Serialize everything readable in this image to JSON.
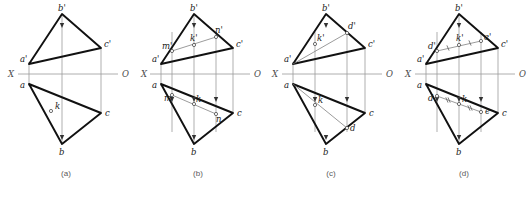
{
  "figure": {
    "title": "",
    "kind": "descriptive-geometry-projection-plates",
    "canvas": {
      "width": 529,
      "height": 197
    },
    "axis": {
      "left_label": "X",
      "right_label": "O",
      "y": 74
    },
    "panels": [
      {
        "id": "a",
        "caption": "(a)",
        "caption_x": 66,
        "caption_y": 176,
        "origin_x": 0,
        "axis_x_label_x": 8,
        "axis_x_label_y": 77,
        "axis_o_label_x": 122,
        "axis_o_label_y": 77,
        "axis_start": 18,
        "axis_end": 118,
        "vertices": {
          "b_prime": {
            "x": 62,
            "y": 14,
            "label": "b'",
            "lx": 58,
            "ly": 11
          },
          "c_prime": {
            "x": 101,
            "y": 48,
            "label": "c'",
            "lx": 104,
            "ly": 47
          },
          "a_prime": {
            "x": 29,
            "y": 64,
            "label": "a'",
            "lx": 20,
            "ly": 62
          },
          "a": {
            "x": 29,
            "y": 84,
            "label": "a",
            "lx": 20,
            "ly": 88
          },
          "c": {
            "x": 101,
            "y": 113,
            "label": "c",
            "lx": 105,
            "ly": 116
          },
          "b": {
            "x": 62,
            "y": 144,
            "label": "b",
            "lx": 59,
            "ly": 155
          },
          "k": {
            "x": 51,
            "y": 111,
            "label": "k",
            "lx": 55,
            "ly": 109
          }
        },
        "extra_points": [
          {
            "name": "k",
            "x": 51,
            "y": 111,
            "label": "k",
            "lx": 55,
            "ly": 109
          }
        ],
        "arrows": [],
        "verticals": [
          29,
          62,
          101
        ],
        "ticks": []
      },
      {
        "id": "b",
        "caption": "(b)",
        "caption_x": 198,
        "caption_y": 176,
        "origin_x": 130,
        "axis_x_label_x": 141,
        "axis_x_label_y": 77,
        "axis_o_label_x": 254,
        "axis_o_label_y": 77,
        "axis_pre_label_x": 130,
        "axis_start": 150,
        "axis_end": 250,
        "vertices": {
          "b_prime": {
            "x": 194,
            "y": 14,
            "label": "b'",
            "lx": 190,
            "ly": 11
          },
          "c_prime": {
            "x": 233,
            "y": 48,
            "label": "c'",
            "lx": 236,
            "ly": 47
          },
          "a_prime": {
            "x": 161,
            "y": 64,
            "label": "a'",
            "lx": 152,
            "ly": 62
          },
          "a": {
            "x": 161,
            "y": 84,
            "label": "a",
            "lx": 152,
            "ly": 88
          },
          "c": {
            "x": 233,
            "y": 113,
            "label": "c",
            "lx": 237,
            "ly": 116
          },
          "b": {
            "x": 194,
            "y": 144,
            "label": "b",
            "lx": 191,
            "ly": 155
          }
        },
        "extra_points": [
          {
            "name": "m_prime",
            "x": 172,
            "y": 51,
            "label": "m'",
            "lx": 162,
            "ly": 49
          },
          {
            "name": "k_prime",
            "x": 194,
            "y": 45,
            "label": "k'",
            "lx": 190,
            "ly": 41
          },
          {
            "name": "n_prime",
            "x": 216,
            "y": 37,
            "label": "n'",
            "lx": 215,
            "ly": 33
          },
          {
            "name": "m",
            "x": 172,
            "y": 95,
            "label": "m",
            "lx": 164,
            "ly": 101
          },
          {
            "name": "k",
            "x": 194,
            "y": 104,
            "label": "k",
            "lx": 196,
            "ly": 102
          },
          {
            "name": "n",
            "x": 216,
            "y": 114,
            "label": "n",
            "lx": 216,
            "ly": 122
          }
        ],
        "verticals": [
          161,
          172,
          194,
          216,
          233
        ],
        "arrow_columns": [
          172,
          194,
          216
        ],
        "ticks": []
      },
      {
        "id": "c",
        "caption": "(c)",
        "caption_x": 331,
        "caption_y": 176,
        "origin_x": 263,
        "axis_x_label_x": 272,
        "axis_x_label_y": 77,
        "axis_o_label_x": 386,
        "axis_o_label_y": 77,
        "axis_start": 282,
        "axis_end": 382,
        "vertices": {
          "b_prime": {
            "x": 326,
            "y": 14,
            "label": "b'",
            "lx": 322,
            "ly": 11
          },
          "c_prime": {
            "x": 365,
            "y": 48,
            "label": "c'",
            "lx": 368,
            "ly": 47
          },
          "a_prime": {
            "x": 293,
            "y": 64,
            "label": "a'",
            "lx": 284,
            "ly": 62
          },
          "a": {
            "x": 293,
            "y": 84,
            "label": "a",
            "lx": 284,
            "ly": 88
          },
          "c": {
            "x": 365,
            "y": 113,
            "label": "c",
            "lx": 369,
            "ly": 116
          },
          "b": {
            "x": 326,
            "y": 144,
            "label": "b",
            "lx": 323,
            "ly": 155
          }
        },
        "extra_points": [
          {
            "name": "k_prime",
            "x": 315,
            "y": 44,
            "label": "k'",
            "lx": 317,
            "ly": 41
          },
          {
            "name": "d_prime",
            "x": 347,
            "y": 33,
            "label": "d'",
            "lx": 348,
            "ly": 29
          },
          {
            "name": "k",
            "x": 315,
            "y": 105,
            "label": "k",
            "lx": 318,
            "ly": 103
          },
          {
            "name": "d",
            "x": 347,
            "y": 128,
            "label": "d",
            "lx": 350,
            "ly": 131
          }
        ],
        "verticals": [
          293,
          315,
          347,
          365
        ],
        "arrow_columns": [
          315,
          347
        ],
        "ticks": []
      },
      {
        "id": "d",
        "caption": "(d)",
        "caption_x": 464,
        "caption_y": 176,
        "origin_x": 396,
        "axis_x_label_x": 405,
        "axis_x_label_y": 77,
        "axis_o_label_x": 519,
        "axis_o_label_y": 77,
        "axis_start": 415,
        "axis_end": 515,
        "vertices": {
          "b_prime": {
            "x": 459,
            "y": 14,
            "label": "b'",
            "lx": 455,
            "ly": 11
          },
          "c_prime": {
            "x": 498,
            "y": 48,
            "label": "c'",
            "lx": 501,
            "ly": 47
          },
          "a_prime": {
            "x": 426,
            "y": 64,
            "label": "a'",
            "lx": 417,
            "ly": 62
          },
          "a": {
            "x": 426,
            "y": 84,
            "label": "a",
            "lx": 417,
            "ly": 88
          },
          "c": {
            "x": 498,
            "y": 113,
            "label": "c",
            "lx": 502,
            "ly": 116
          },
          "b": {
            "x": 459,
            "y": 144,
            "label": "b",
            "lx": 456,
            "ly": 155
          }
        },
        "extra_points": [
          {
            "name": "d_prime",
            "x": 437,
            "y": 51,
            "label": "d'",
            "lx": 428,
            "ly": 49
          },
          {
            "name": "k_prime",
            "x": 459,
            "y": 45,
            "label": "k'",
            "lx": 456,
            "ly": 41
          },
          {
            "name": "e_prime",
            "x": 481,
            "y": 41,
            "label": "e'",
            "lx": 484,
            "ly": 40
          },
          {
            "name": "d",
            "x": 437,
            "y": 96,
            "label": "d",
            "lx": 428,
            "ly": 101
          },
          {
            "name": "k",
            "x": 459,
            "y": 104,
            "label": "k",
            "lx": 462,
            "ly": 102
          },
          {
            "name": "e",
            "x": 481,
            "y": 112,
            "label": "e",
            "lx": 485,
            "ly": 114
          }
        ],
        "verticals": [
          426,
          437,
          459,
          481,
          498
        ],
        "arrow_columns": [
          437,
          459,
          481
        ],
        "ticks": [
          {
            "x": 448,
            "y": 48,
            "count": 1
          },
          {
            "x": 470,
            "y": 43,
            "count": 1
          },
          {
            "x": 448,
            "y": 100,
            "count": 2
          },
          {
            "x": 470,
            "y": 108,
            "count": 2
          }
        ]
      }
    ]
  },
  "icons": {
    "arrow_down": "downward-arrowhead",
    "point_marker": "open-circle-point"
  },
  "colors": {
    "heavy_line": "#111111",
    "light_line": "#8d8d8d",
    "axis_line": "#9a9a9a",
    "label_text": "#1a1a1a",
    "caption_text": "#5a5a5a",
    "background": "#ffffff"
  }
}
